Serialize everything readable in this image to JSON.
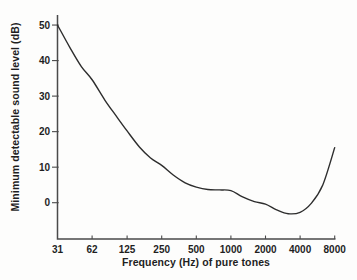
{
  "figure": {
    "background": "#fdfdfc",
    "ink": "#2d2d2d",
    "axis_color": "#4a4a4a",
    "text_color": "#1f1f1f"
  },
  "chart_data": {
    "type": "line",
    "title": "",
    "xlabel": "Frequency (Hz) of pure tones",
    "ylabel": "Minimum detectable sound level (dB)",
    "x_scale": "log2",
    "grid": false,
    "legend": "none",
    "xlim": [
      31,
      8000
    ],
    "ylim": [
      -10,
      53
    ],
    "x_ticks": [
      31,
      62,
      125,
      250,
      500,
      1000,
      2000,
      4000,
      8000
    ],
    "x_tick_labels": [
      "31",
      "62",
      "125",
      "250",
      "500",
      "1000",
      "2000",
      "4000",
      "8000"
    ],
    "y_ticks": [
      0,
      10,
      20,
      30,
      40,
      50
    ],
    "y_tick_labels": [
      "0",
      "10",
      "20",
      "30",
      "40",
      "50"
    ],
    "series": [
      {
        "name": "minimum detectable sound level",
        "x": [
          31,
          40,
          50,
          62,
          80,
          100,
          125,
          160,
          200,
          250,
          315,
          400,
          500,
          630,
          800,
          1000,
          1250,
          1600,
          2000,
          2500,
          3150,
          4000,
          5000,
          6300,
          8000
        ],
        "y": [
          50,
          43.5,
          38.3,
          34.6,
          28.9,
          24.5,
          20.2,
          15.7,
          12.6,
          10.5,
          7.8,
          5.6,
          4.4,
          3.7,
          3.6,
          3.4,
          1.7,
          0.3,
          -0.4,
          -2.0,
          -3.1,
          -2.7,
          -0.2,
          5.0,
          15.5
        ]
      }
    ]
  }
}
